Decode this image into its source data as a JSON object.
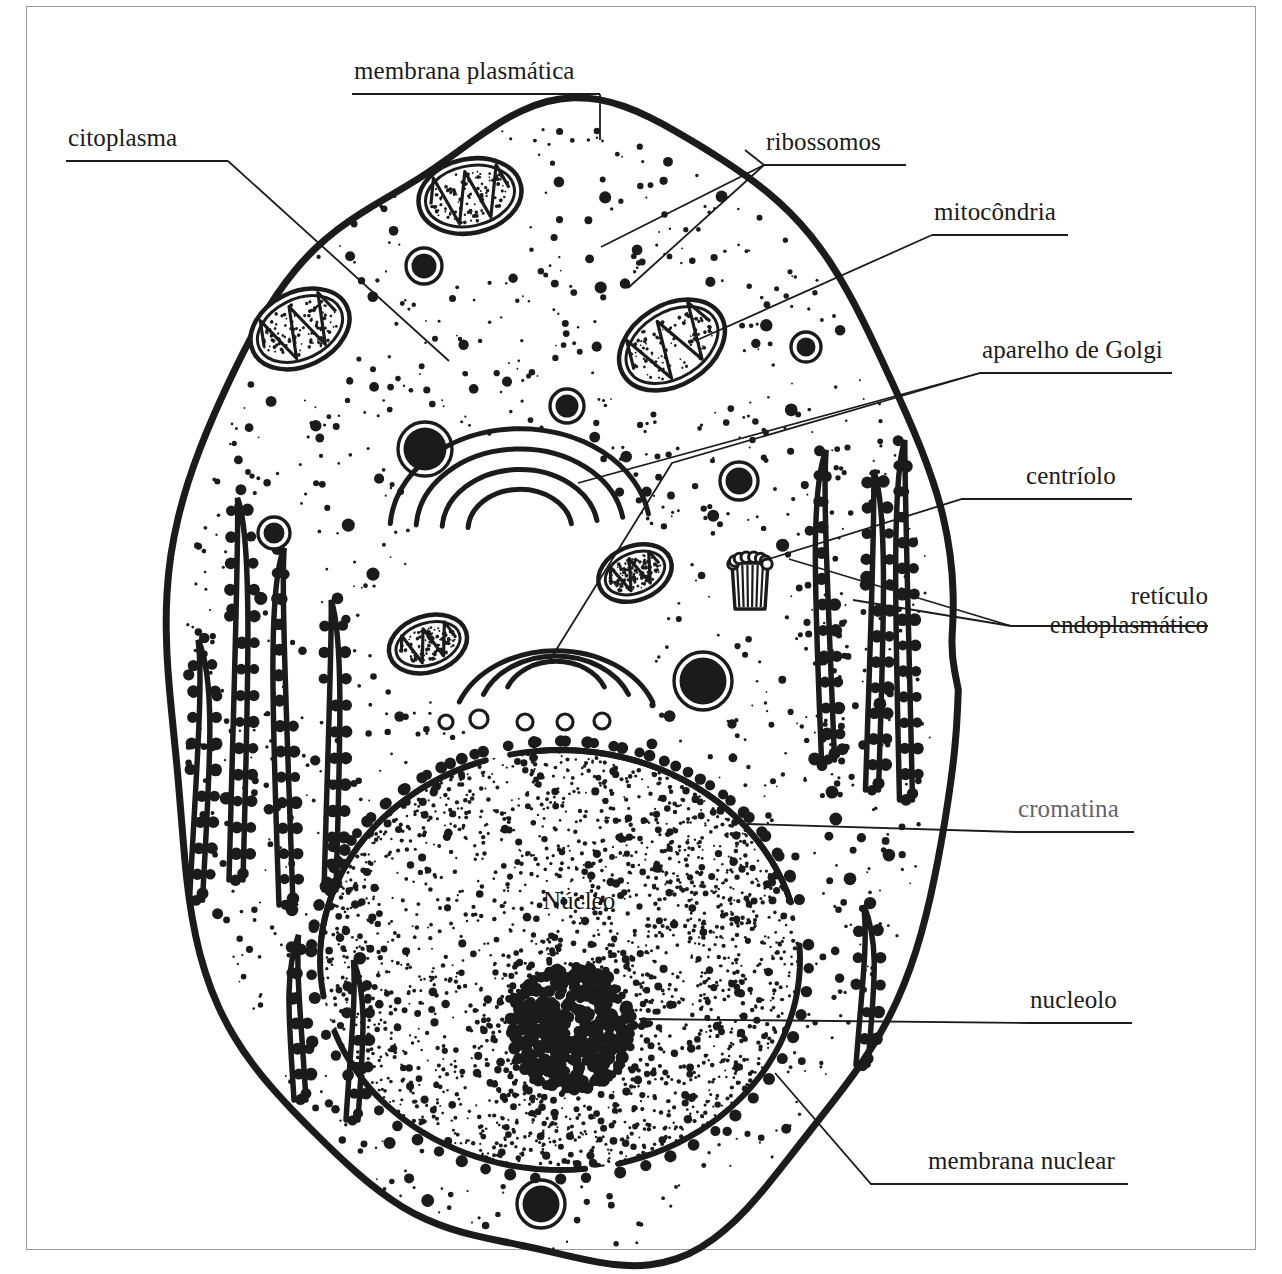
{
  "figure": {
    "kind": "animal-cell-diagram",
    "language": "pt-BR",
    "title_text": "",
    "background": "#ffffff",
    "ink": "#1b1b1b",
    "frame_color": "#9b9b9b"
  },
  "inner_labels": [
    {
      "id": "nucleo",
      "text": "Núcleo",
      "x": 543,
      "y": 887
    }
  ],
  "labels": [
    {
      "id": "membrana-plasmatica",
      "text": "membrana plasmática",
      "x": 354,
      "y": 57,
      "align": "left",
      "lines": 1,
      "rule": {
        "x1": 352,
        "y1": 94,
        "x2": 600,
        "y2": 94
      },
      "leaders": [
        [
          [
            600,
            94
          ],
          [
            600,
            140
          ]
        ]
      ]
    },
    {
      "id": "citoplasma",
      "text": "citoplasma",
      "x": 68,
      "y": 124,
      "align": "left",
      "lines": 1,
      "rule": {
        "x1": 66,
        "y1": 161,
        "x2": 228,
        "y2": 161
      },
      "leaders": [
        [
          [
            228,
            161
          ],
          [
            449,
            361
          ]
        ]
      ]
    },
    {
      "id": "ribossomos",
      "text": "ribossomos",
      "x": 766,
      "y": 128,
      "align": "left",
      "lines": 1,
      "rule": {
        "x1": 764,
        "y1": 165,
        "x2": 906,
        "y2": 165
      },
      "leaders": [
        [
          [
            764,
            165
          ],
          [
            745,
            150
          ]
        ],
        [
          [
            764,
            165
          ],
          [
            601,
            247
          ]
        ],
        [
          [
            764,
            165
          ],
          [
            628,
            288
          ]
        ]
      ]
    },
    {
      "id": "mitocondria",
      "text": "mitocôndria",
      "x": 934,
      "y": 198,
      "align": "left",
      "lines": 1,
      "rule": {
        "x1": 932,
        "y1": 235,
        "x2": 1068,
        "y2": 235
      },
      "leaders": [
        [
          [
            932,
            235
          ],
          [
            695,
            341
          ]
        ]
      ]
    },
    {
      "id": "aparelho-de-golgi",
      "text": "aparelho de Golgi",
      "x": 982,
      "y": 336,
      "align": "left",
      "lines": 1,
      "rule": {
        "x1": 980,
        "y1": 373,
        "x2": 1172,
        "y2": 373
      },
      "leaders": [
        [
          [
            980,
            373
          ],
          [
            578,
            483
          ]
        ],
        [
          [
            980,
            373
          ],
          [
            672,
            463
          ],
          [
            548,
            663
          ]
        ]
      ]
    },
    {
      "id": "centriolo",
      "text": "centríolo",
      "x": 1026,
      "y": 462,
      "align": "left",
      "lines": 1,
      "rule": {
        "x1": 1024,
        "y1": 499,
        "x2": 1132,
        "y2": 499
      },
      "leaders": [
        [
          [
            1024,
            499
          ],
          [
            962,
            499
          ],
          [
            756,
            563
          ]
        ]
      ]
    },
    {
      "id": "reticulo-endoplasmatico",
      "text": "retículo\nendoplasmático",
      "x": 1017,
      "y": 582,
      "align": "right",
      "lines": 2,
      "rule": {
        "x1": 1011,
        "y1": 626,
        "x2": 1208,
        "y2": 626
      },
      "leaders": [
        [
          [
            1011,
            626
          ],
          [
            789,
            559
          ]
        ],
        [
          [
            1011,
            626
          ],
          [
            853,
            600
          ]
        ]
      ]
    },
    {
      "id": "cromatina",
      "text": "cromatina",
      "x": 1018,
      "y": 795,
      "align": "left",
      "lines": 1,
      "faded": true,
      "rule": {
        "x1": 1016,
        "y1": 832,
        "x2": 1134,
        "y2": 832
      },
      "leaders": [
        [
          [
            1016,
            832
          ],
          [
            747,
            824
          ]
        ]
      ]
    },
    {
      "id": "nucleolo",
      "text": "nucleolo",
      "x": 1030,
      "y": 986,
      "align": "left",
      "lines": 1,
      "rule": {
        "x1": 1028,
        "y1": 1023,
        "x2": 1132,
        "y2": 1023
      },
      "leaders": [
        [
          [
            1028,
            1023
          ],
          [
            639,
            1019
          ]
        ]
      ]
    },
    {
      "id": "membrana-nuclear",
      "text": "membrana nuclear",
      "x": 928,
      "y": 1147,
      "align": "left",
      "lines": 1,
      "rule": {
        "x1": 926,
        "y1": 1184,
        "x2": 1128,
        "y2": 1184
      },
      "leaders": [
        [
          [
            926,
            1184
          ],
          [
            871,
            1184
          ],
          [
            775,
            1073
          ]
        ]
      ]
    }
  ],
  "organelles": {
    "mitochondria": [
      {
        "cx": 470,
        "cy": 196,
        "rx": 52,
        "ry": 37,
        "rot": -12
      },
      {
        "cx": 300,
        "cy": 329,
        "rx": 52,
        "ry": 37,
        "rot": -26
      },
      {
        "cx": 672,
        "cy": 345,
        "rx": 57,
        "ry": 40,
        "rot": -32
      },
      {
        "cx": 635,
        "cy": 573,
        "rx": 38,
        "ry": 27,
        "rot": -22
      },
      {
        "cx": 428,
        "cy": 644,
        "rx": 40,
        "ry": 28,
        "rot": -18
      }
    ],
    "lysosomes": [
      {
        "cx": 424,
        "cy": 266,
        "r": 18
      },
      {
        "cx": 567,
        "cy": 406,
        "r": 17
      },
      {
        "cx": 425,
        "cy": 449,
        "r": 27
      },
      {
        "cx": 739,
        "cy": 481,
        "r": 19
      },
      {
        "cx": 806,
        "cy": 347,
        "r": 15
      },
      {
        "cx": 274,
        "cy": 533,
        "r": 16
      },
      {
        "cx": 703,
        "cy": 681,
        "r": 29
      },
      {
        "cx": 541,
        "cy": 1204,
        "r": 24
      }
    ],
    "golgi": [
      {
        "id": "golgi-upper",
        "cx": 520,
        "cy": 530,
        "arcs": 4,
        "flip": false
      },
      {
        "id": "golgi-lower",
        "cx": 556,
        "cy": 672,
        "arcs": 3,
        "flip": true
      }
    ],
    "vesicles": [
      {
        "cx": 446,
        "cy": 722,
        "r": 7
      },
      {
        "cx": 479,
        "cy": 719,
        "r": 9
      },
      {
        "cx": 525,
        "cy": 722,
        "r": 8
      },
      {
        "cx": 565,
        "cy": 722,
        "r": 8
      },
      {
        "cx": 602,
        "cy": 721,
        "r": 8
      }
    ],
    "centriole": {
      "cx": 750,
      "cy": 578,
      "w": 36,
      "h": 46,
      "staves": 7,
      "top_circles": 8
    },
    "nucleus": {
      "cx": 560,
      "cy": 960,
      "rx": 240,
      "ry": 210
    },
    "nucleolus": {
      "cx": 571,
      "cy": 1028,
      "r": 63
    }
  },
  "counts": {
    "er_strands_left": 6,
    "er_strands_right": 5,
    "nuclear_envelope_segments": 6
  }
}
